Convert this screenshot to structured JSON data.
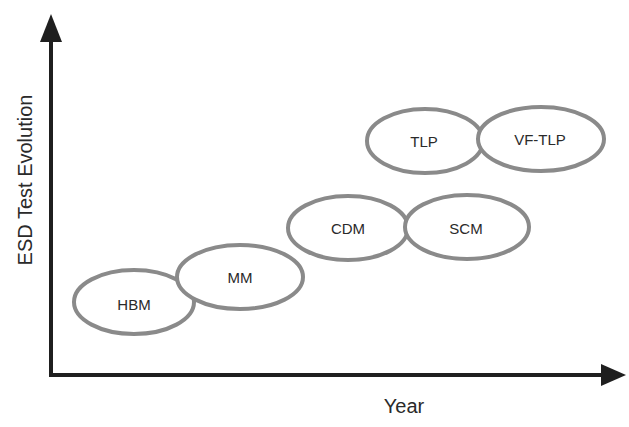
{
  "diagram": {
    "y_axis_label": "ESD Test Evolution",
    "x_axis_label": "Year",
    "colors": {
      "axis": "#1f1f1f",
      "ellipse_stroke": "#8a8a8a",
      "ellipse_fill": "#ffffff",
      "text": "#2a2a2a"
    },
    "nodes": [
      {
        "id": "hbm",
        "label": "HBM"
      },
      {
        "id": "mm",
        "label": "MM"
      },
      {
        "id": "cdm",
        "label": "CDM"
      },
      {
        "id": "scm",
        "label": "SCM"
      },
      {
        "id": "tlp",
        "label": "TLP"
      },
      {
        "id": "vf-tlp",
        "label": "VF-TLP"
      }
    ]
  }
}
